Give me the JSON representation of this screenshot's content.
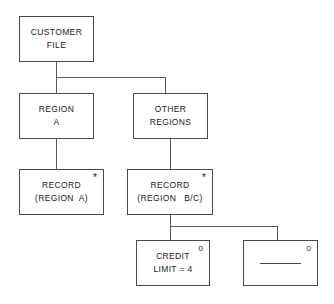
{
  "diagram": {
    "type": "hierarchical-tree",
    "nodes": [
      {
        "id": "customer-file",
        "lines": [
          "CUSTOMER",
          "FILE"
        ],
        "marker": "",
        "blank": false
      },
      {
        "id": "region-a",
        "lines": [
          "REGION",
          "A"
        ],
        "marker": "",
        "blank": false
      },
      {
        "id": "other-regions",
        "lines": [
          "OTHER",
          "REGIONS"
        ],
        "marker": "",
        "blank": false
      },
      {
        "id": "record-region-a",
        "lines": [
          "RECORD",
          "(REGION  A)"
        ],
        "marker": "*",
        "blank": false
      },
      {
        "id": "record-region-bc",
        "lines": [
          "RECORD",
          "(REGION   B/C)"
        ],
        "marker": "*",
        "blank": false
      },
      {
        "id": "credit-limit",
        "lines": [
          "CREDIT",
          "LIMIT = 4"
        ],
        "marker": "0",
        "blank": false
      },
      {
        "id": "blank-node",
        "lines": [
          "",
          ""
        ],
        "marker": "0",
        "blank": true
      }
    ],
    "edges": [
      {
        "from": "customer-file",
        "to": "region-a"
      },
      {
        "from": "customer-file",
        "to": "other-regions"
      },
      {
        "from": "region-a",
        "to": "record-region-a"
      },
      {
        "from": "other-regions",
        "to": "record-region-bc"
      },
      {
        "from": "record-region-bc",
        "to": "credit-limit"
      },
      {
        "from": "record-region-bc",
        "to": "blank-node"
      }
    ],
    "colors": {
      "box_border": "#4a4a4a",
      "connector": "#5a5a5a",
      "text": "#1a1a1a",
      "background": "#ffffff"
    }
  }
}
